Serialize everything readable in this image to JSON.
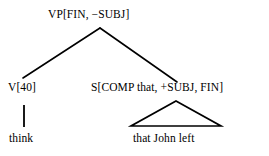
{
  "figure": {
    "kind": "syntactic-parse-tree",
    "background_color": "#ffffff",
    "ink_color": "#000000"
  },
  "tree": {
    "root": {
      "label": "VP[FIN, −SUBJ]"
    },
    "children": [
      {
        "label": "V[40]",
        "terminal": "think",
        "link": "vertical-stem"
      },
      {
        "label": "S[COMP that, +SUBJ, FIN]",
        "terminal": "that John left",
        "link": "triangle"
      }
    ]
  }
}
